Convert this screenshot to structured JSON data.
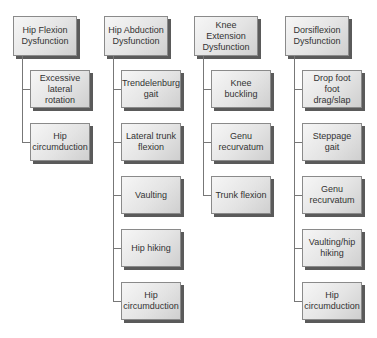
{
  "diagram": {
    "columns": [
      {
        "root": "Hip Flexion Dysfunction",
        "children": [
          "Excessive lateral rotation",
          "Hip circumduction"
        ]
      },
      {
        "root": "Hip Abduction Dysfunction",
        "children": [
          "Trendelenburg gait",
          "Lateral trunk flexion",
          "Vaulting",
          "Hip hiking",
          "Hip circumduction"
        ]
      },
      {
        "root": "Knee Extension Dysfunction",
        "children": [
          "Knee buckling",
          "Genu recurvatum",
          "Trunk flexion"
        ]
      },
      {
        "root": "Dorsiflexion Dysfunction",
        "children": [
          "Drop foot foot drag/slap",
          "Steppage gait",
          "Genu recurvatum",
          "Vaulting/hip hiking",
          "Hip circumduction"
        ]
      }
    ]
  }
}
